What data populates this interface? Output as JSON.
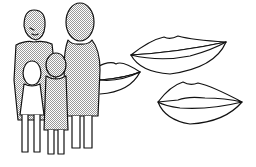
{
  "illustration": {
    "description": "Line drawing of a family of four figures beside three pairs of lips",
    "figures": [
      "adult-man",
      "adult-woman",
      "child-girl",
      "child-boy"
    ],
    "lips_count": 3,
    "colors": {
      "stroke": "#111111",
      "fill_figures": "#d8d8d8",
      "background": "#ffffff"
    }
  }
}
